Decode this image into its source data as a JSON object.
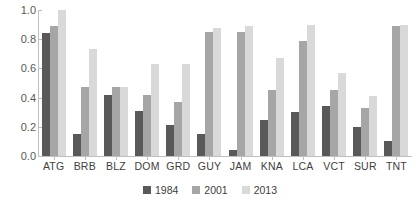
{
  "chart_data": {
    "type": "bar",
    "title": "",
    "subtitle": "",
    "xlabel": "",
    "ylabel": "",
    "ylim": [
      0.0,
      1.0
    ],
    "grid": false,
    "legend_position": "bottom",
    "ytick_labels": [
      "1.0",
      "0.8",
      "0.6",
      "0.4",
      "0.2",
      "0.0"
    ],
    "ytick_values": [
      1.0,
      0.8,
      0.6,
      0.4,
      0.2,
      0.0
    ],
    "categories": [
      "ATG",
      "BRB",
      "BLZ",
      "DOM",
      "GRD",
      "GUY",
      "JAM",
      "KNA",
      "LCA",
      "VCT",
      "SUR",
      "TNT"
    ],
    "series": [
      {
        "name": "1984",
        "color": "#595959",
        "values": [
          0.84,
          0.15,
          0.42,
          0.31,
          0.21,
          0.15,
          0.04,
          0.25,
          0.3,
          0.34,
          0.2,
          0.1
        ]
      },
      {
        "name": "2001",
        "color": "#a6a6a6",
        "values": [
          0.89,
          0.47,
          0.47,
          0.42,
          0.37,
          0.85,
          0.85,
          0.45,
          0.79,
          0.45,
          0.33,
          0.89
        ]
      },
      {
        "name": "2013",
        "color": "#d9d9d9",
        "values": [
          1.0,
          0.73,
          0.47,
          0.63,
          0.63,
          0.88,
          0.89,
          0.67,
          0.9,
          0.57,
          0.41,
          0.9
        ]
      }
    ]
  },
  "legend": {
    "items": [
      {
        "label": "1984",
        "color": "#595959"
      },
      {
        "label": "2001",
        "color": "#a6a6a6"
      },
      {
        "label": "2013",
        "color": "#d9d9d9"
      }
    ]
  },
  "colors": {
    "axis": "#bfbfbf",
    "tick_text": "#595959",
    "label_text": "#404040",
    "background": "#ffffff"
  }
}
